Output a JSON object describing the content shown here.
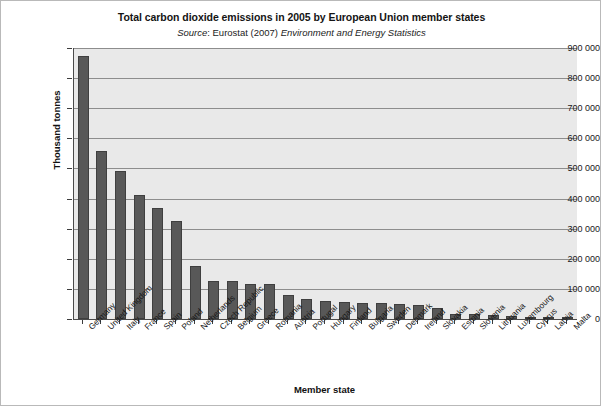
{
  "chart_data": {
    "type": "bar",
    "title": "Total carbon dioxide emissions in 2005 by European Union member states",
    "subtitle": {
      "source_label": "Source",
      "source_separator": ": ",
      "source_body": "Eurostat (2007) ",
      "source_italic": "Environment and Energy Statistics"
    },
    "xlabel": "Member state",
    "ylabel": "Thousand tonnes",
    "ylim": [
      0,
      900000
    ],
    "ytick_values": [
      0,
      100000,
      200000,
      300000,
      400000,
      500000,
      600000,
      700000,
      800000,
      900000
    ],
    "ytick_labels": [
      "0",
      "100 000",
      "200 000",
      "300 000",
      "400 000",
      "500 000",
      "600 000",
      "700 000",
      "800 000",
      "900 000"
    ],
    "grid": true,
    "legend": false,
    "legend_position": "none",
    "bar_color": "#585858",
    "plot_background": "#e9e9e9",
    "gridline_color": "#8d8d8d",
    "categories": [
      "Germany",
      "United Kingdom",
      "Italy",
      "France",
      "Spain",
      "Poland",
      "Netherlands",
      "Czech Republic",
      "Belgium",
      "Greece",
      "Romania",
      "Austria",
      "Portugal",
      "Hungary",
      "Finland",
      "Bulgaria",
      "Sweden",
      "Denmark",
      "Ireland",
      "Slovakia",
      "Estonia",
      "Slovenia",
      "Lithuania",
      "Luxembourg",
      "Cyprus",
      "Latvia",
      "Malta"
    ],
    "values": [
      873000,
      558000,
      492000,
      412000,
      370000,
      325000,
      176000,
      126000,
      125000,
      116000,
      115000,
      79000,
      65000,
      60000,
      57000,
      53000,
      52000,
      50000,
      46000,
      38000,
      17000,
      16000,
      14000,
      11000,
      7500,
      7000,
      2500
    ]
  }
}
